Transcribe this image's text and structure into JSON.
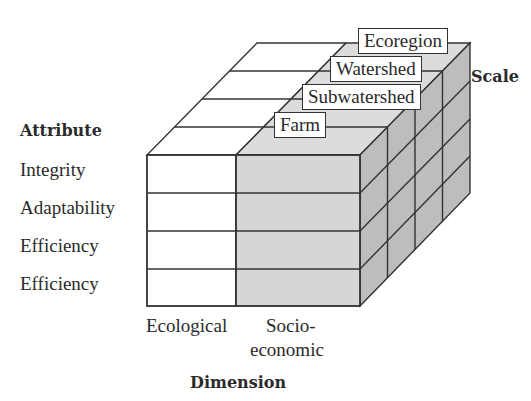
{
  "figure": {
    "attribute_axis": {
      "title": "Attribute",
      "items": [
        "Integrity",
        "Adaptability",
        "Efficiency",
        "Efficiency"
      ]
    },
    "dimension_axis": {
      "title": "Dimension",
      "items": [
        "Ecological",
        "Socio-",
        "economic"
      ]
    },
    "scale_axis": {
      "title": "Scale",
      "items": [
        "Farm",
        "Subwatershed",
        "Watershed",
        "Ecoregion"
      ]
    },
    "colors": {
      "ecological_face": "#ffffff",
      "socioeconomic_face": "#d6d6d6",
      "side_face": "#b8b8b8",
      "line": "#333333"
    }
  }
}
